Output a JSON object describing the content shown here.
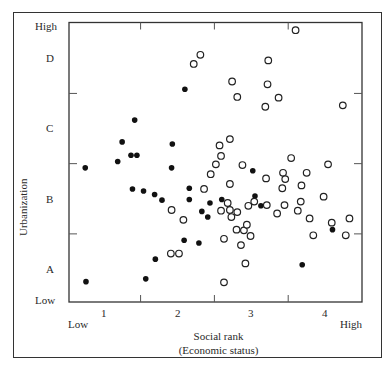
{
  "chart_data": {
    "type": "scatter",
    "title": "",
    "xlabel": "Social rank",
    "xlabel_sub": "(Economic status)",
    "ylabel": "Urbanization",
    "x_ticks": [
      "1",
      "2",
      "3",
      "4"
    ],
    "x_tick_values": [
      1,
      2,
      3,
      4
    ],
    "x_ends": {
      "low": "Low",
      "high": "High"
    },
    "y_ticks": [
      "A",
      "B",
      "C",
      "D"
    ],
    "y_tick_values": [
      1,
      2,
      3,
      4
    ],
    "y_ends": {
      "low": "Low",
      "high": "High"
    },
    "xlim": [
      0.53,
      4.5
    ],
    "ylim": [
      0.53,
      4.51
    ],
    "grid": false,
    "legend": "none",
    "series": [
      {
        "name": "filled",
        "marker": "filled-circle",
        "points": [
          [
            0.76,
            0.82
          ],
          [
            1.57,
            0.86
          ],
          [
            1.7,
            1.14
          ],
          [
            2.09,
            1.41
          ],
          [
            2.29,
            1.37
          ],
          [
            1.39,
            2.14
          ],
          [
            1.54,
            2.11
          ],
          [
            1.69,
            2.06
          ],
          [
            1.79,
            1.98
          ],
          [
            2.16,
            2.15
          ],
          [
            2.16,
            1.99
          ],
          [
            2.44,
            1.94
          ],
          [
            2.6,
            1.99
          ],
          [
            2.33,
            1.82
          ],
          [
            2.41,
            1.74
          ],
          [
            3.05,
            2.04
          ],
          [
            3.13,
            1.9
          ],
          [
            4.1,
            1.56
          ],
          [
            3.69,
            1.06
          ],
          [
            0.75,
            2.44
          ],
          [
            1.19,
            2.53
          ],
          [
            1.37,
            2.62
          ],
          [
            1.45,
            2.62
          ],
          [
            1.25,
            2.81
          ],
          [
            1.42,
            3.12
          ],
          [
            1.93,
            2.78
          ],
          [
            1.92,
            2.44
          ],
          [
            3.02,
            2.4
          ],
          [
            2.1,
            3.56
          ]
        ]
      },
      {
        "name": "open",
        "marker": "open-circle",
        "points": [
          [
            3.6,
            4.4
          ],
          [
            2.31,
            4.05
          ],
          [
            2.22,
            3.92
          ],
          [
            3.23,
            3.97
          ],
          [
            2.74,
            3.67
          ],
          [
            3.22,
            3.63
          ],
          [
            2.81,
            3.45
          ],
          [
            3.37,
            3.44
          ],
          [
            3.19,
            3.31
          ],
          [
            4.24,
            3.33
          ],
          [
            2.71,
            2.85
          ],
          [
            2.57,
            2.76
          ],
          [
            2.59,
            2.61
          ],
          [
            2.52,
            2.49
          ],
          [
            2.45,
            2.35
          ],
          [
            2.88,
            2.48
          ],
          [
            3.54,
            2.58
          ],
          [
            4.04,
            2.49
          ],
          [
            3.43,
            2.37
          ],
          [
            3.46,
            2.28
          ],
          [
            3.75,
            2.37
          ],
          [
            3.2,
            2.29
          ],
          [
            2.71,
            2.21
          ],
          [
            2.36,
            2.14
          ],
          [
            3.42,
            2.15
          ],
          [
            3.68,
            2.19
          ],
          [
            3.98,
            2.03
          ],
          [
            3.67,
            1.96
          ],
          [
            2.68,
            1.94
          ],
          [
            3.04,
            1.96
          ],
          [
            2.59,
            1.83
          ],
          [
            2.71,
            1.84
          ],
          [
            2.81,
            1.81
          ],
          [
            2.73,
            1.74
          ],
          [
            2.96,
            1.9
          ],
          [
            3.21,
            1.91
          ],
          [
            3.45,
            1.91
          ],
          [
            3.35,
            1.79
          ],
          [
            3.63,
            1.83
          ],
          [
            3.79,
            1.72
          ],
          [
            4.09,
            1.66
          ],
          [
            4.33,
            1.72
          ],
          [
            3.84,
            1.48
          ],
          [
            4.28,
            1.48
          ],
          [
            1.92,
            1.84
          ],
          [
            2.08,
            1.7
          ],
          [
            2.8,
            1.56
          ],
          [
            2.9,
            1.55
          ],
          [
            2.94,
            1.63
          ],
          [
            2.99,
            1.47
          ],
          [
            2.63,
            1.43
          ],
          [
            2.86,
            1.34
          ],
          [
            1.91,
            1.22
          ],
          [
            2.02,
            1.22
          ],
          [
            2.92,
            1.08
          ],
          [
            2.63,
            0.81
          ]
        ]
      }
    ]
  },
  "colors": {
    "ink": "#2a2a2a",
    "frame": "#333333",
    "background": "#ffffff"
  }
}
